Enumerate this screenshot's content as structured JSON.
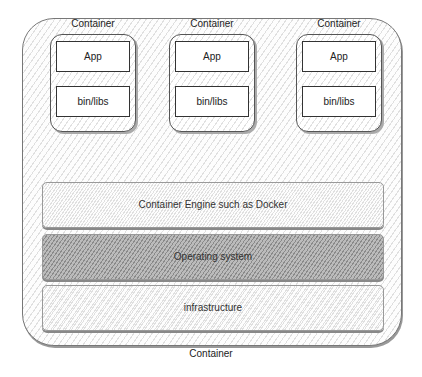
{
  "outer_container": {
    "label": "Container"
  },
  "containers": [
    {
      "label": "Container",
      "app": "App",
      "libs": "bin/libs"
    },
    {
      "label": "Container",
      "app": "App",
      "libs": "bin/libs"
    },
    {
      "label": "Container",
      "app": "App",
      "libs": "bin/libs"
    }
  ],
  "layers": [
    {
      "label": "Container Engine such as Docker"
    },
    {
      "label": "Operating system"
    },
    {
      "label": "infrastructure"
    }
  ]
}
